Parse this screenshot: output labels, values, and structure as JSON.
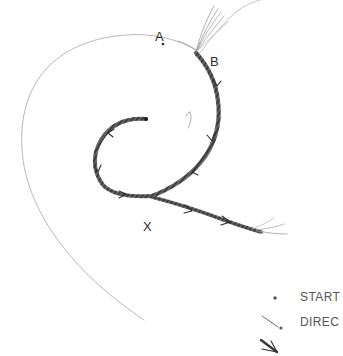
{
  "figure": {
    "background_color": "#ffffff",
    "ink_color_dark": "#3a3a3a",
    "ink_color_light": "#b5b5b5",
    "label_color": "#2b2b2b",
    "legend_text_color": "#555555",
    "annotations": [
      {
        "id": "A",
        "label": "A",
        "description": "point marked by small dot on thin outer spiral"
      },
      {
        "id": "B",
        "label": "B",
        "description": "junction where fan of fine lines leaves the band"
      },
      {
        "id": "X",
        "label": "X",
        "description": "junction where outgoing tail leaves the spiral band"
      }
    ],
    "legend": {
      "items": [
        {
          "symbol": "start-dot",
          "label": "START"
        },
        {
          "symbol": "direction-line-dot",
          "label": "DIREC"
        },
        {
          "symbol": "arrow-barb",
          "label": ""
        }
      ]
    }
  }
}
